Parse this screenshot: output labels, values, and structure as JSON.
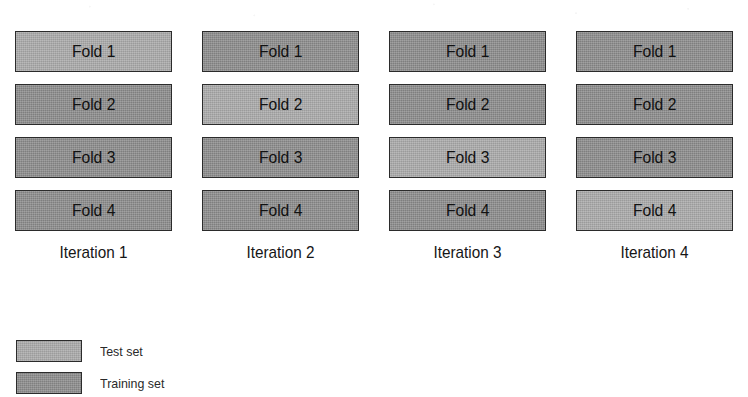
{
  "figure": {
    "kind": "k-fold-cross-validation-diagram",
    "n_folds": 4,
    "n_iterations": 4
  },
  "chart_data": {
    "type": "table",
    "title": "",
    "xlabel": "",
    "ylabel": "",
    "row_labels": [
      "Fold 1",
      "Fold 2",
      "Fold 3",
      "Fold 4"
    ],
    "column_labels": [
      "Iteration 1",
      "Iteration 2",
      "Iteration 3",
      "Iteration 4"
    ],
    "legend": [
      "Test set",
      "Training set"
    ],
    "legend_position": "bottom-left",
    "grid": false,
    "cell_roles": [
      [
        "test",
        "train",
        "train",
        "train"
      ],
      [
        "train",
        "test",
        "train",
        "train"
      ],
      [
        "train",
        "train",
        "test",
        "train"
      ],
      [
        "train",
        "train",
        "train",
        "test"
      ]
    ]
  },
  "columns": [
    {
      "caption": "Iteration 1",
      "blocks": [
        {
          "label": "Fold 1",
          "role": "test"
        },
        {
          "label": "Fold 2",
          "role": "train"
        },
        {
          "label": "Fold 3",
          "role": "train"
        },
        {
          "label": "Fold 4",
          "role": "train"
        }
      ]
    },
    {
      "caption": "Iteration 2",
      "blocks": [
        {
          "label": "Fold 1",
          "role": "train"
        },
        {
          "label": "Fold 2",
          "role": "test"
        },
        {
          "label": "Fold 3",
          "role": "train"
        },
        {
          "label": "Fold 4",
          "role": "train"
        }
      ]
    },
    {
      "caption": "Iteration 3",
      "blocks": [
        {
          "label": "Fold 1",
          "role": "train"
        },
        {
          "label": "Fold 2",
          "role": "train"
        },
        {
          "label": "Fold 3",
          "role": "test"
        },
        {
          "label": "Fold 4",
          "role": "train"
        }
      ]
    },
    {
      "caption": "Iteration 4",
      "blocks": [
        {
          "label": "Fold 1",
          "role": "train"
        },
        {
          "label": "Fold 2",
          "role": "train"
        },
        {
          "label": "Fold 3",
          "role": "train"
        },
        {
          "label": "Fold 4",
          "role": "test"
        }
      ]
    }
  ],
  "legend": {
    "items": [
      {
        "label": "Test set",
        "role": "test"
      },
      {
        "label": "Training set",
        "role": "train"
      }
    ]
  },
  "colors": {
    "test": "#a8a8a8",
    "train": "#8a8a8a",
    "outline": "#2b2b2b",
    "text": "#1a1a1a",
    "background": "#ffffff"
  }
}
